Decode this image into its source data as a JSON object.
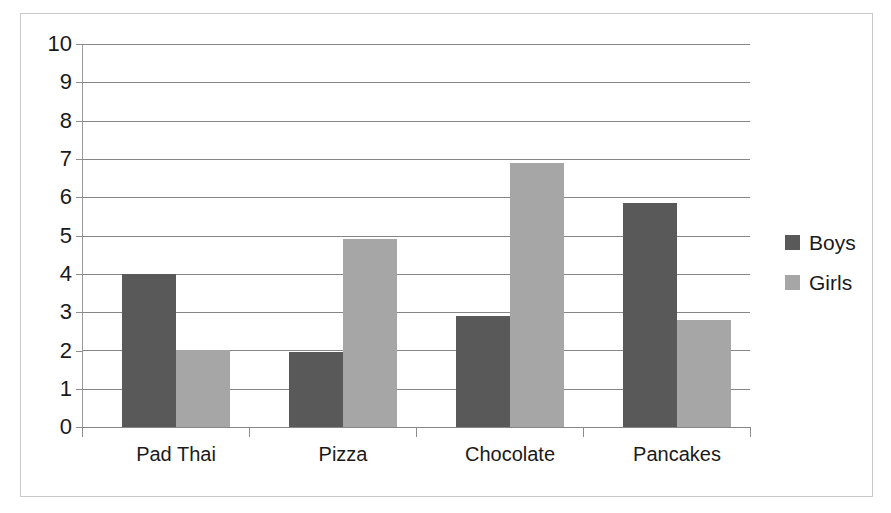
{
  "chart_data": {
    "type": "bar",
    "title": "",
    "subtitle": "",
    "xlabel": "",
    "ylabel": "",
    "categories": [
      "Pad Thai",
      "Pizza",
      "Chocolate",
      "Pancakes"
    ],
    "series": [
      {
        "name": "Boys",
        "color": "#595959",
        "values": [
          4.0,
          1.95,
          2.9,
          5.85
        ]
      },
      {
        "name": "Girls",
        "color": "#a6a6a6",
        "values": [
          2.0,
          4.9,
          6.9,
          2.8
        ]
      }
    ],
    "ylim": [
      0,
      10
    ],
    "ytick_labels": [
      "10",
      "9",
      "8",
      "7",
      "6",
      "5",
      "4",
      "3",
      "2",
      "1",
      "0"
    ],
    "ytick_values": [
      10,
      9,
      8,
      7,
      6,
      5,
      4,
      3,
      2,
      1,
      0
    ],
    "grid": true,
    "grid_axis": "y",
    "legend": {
      "position": "right",
      "entries": [
        "Boys",
        "Girls"
      ]
    },
    "bar_group_gap": true,
    "annotations": []
  },
  "colors": {
    "boys": "#595959",
    "girls": "#a6a6a6",
    "gridline": "#868686",
    "frame": "#c9c9c9",
    "text": "#1a1a1a",
    "background": "#ffffff"
  }
}
